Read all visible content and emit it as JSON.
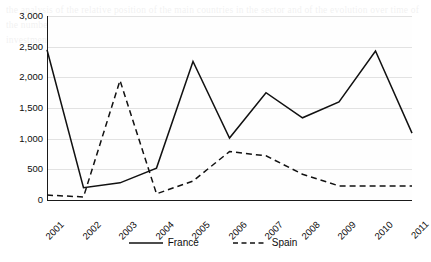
{
  "chart_data": {
    "type": "line",
    "title": "",
    "xlabel": "",
    "ylabel": "",
    "categories": [
      "2001",
      "2002",
      "2003",
      "2004",
      "2005",
      "2006",
      "2007",
      "2008",
      "2009",
      "2010",
      "2011"
    ],
    "ylim": [
      0,
      3000
    ],
    "yticks": [
      0,
      500,
      1000,
      1500,
      2000,
      2500,
      3000
    ],
    "ytick_labels": [
      "0",
      "500",
      "1,000",
      "1,500",
      "2,000",
      "2,500",
      "3,000"
    ],
    "grid": "horizontal",
    "legend_position": "bottom",
    "series": [
      {
        "name": "France",
        "style": "solid",
        "color": "#111111",
        "values": [
          2450,
          200,
          280,
          520,
          2260,
          1010,
          1750,
          1340,
          1600,
          2430,
          1090
        ]
      },
      {
        "name": "Spain",
        "style": "dashed",
        "color": "#111111",
        "values": [
          80,
          50,
          1950,
          100,
          310,
          790,
          720,
          420,
          230,
          230,
          230
        ]
      }
    ]
  },
  "legend": {
    "items": [
      {
        "label": "France",
        "style": "solid"
      },
      {
        "label": "Spain",
        "style": "dashed"
      }
    ]
  },
  "background_text": "the analysis of the relative position of the main countries in the sector and of the evolution over time of the number of operations recorded in each of them, which may be compared with the volume of investment in the area of the market concerned"
}
